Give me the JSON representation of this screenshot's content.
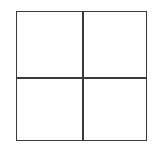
{
  "diagram": {
    "type": "grid",
    "rows": 2,
    "columns": 2,
    "line_color": "#3a3a3a",
    "background": "#ffffff",
    "cells": [
      {
        "row": 0,
        "col": 0,
        "label": ""
      },
      {
        "row": 0,
        "col": 1,
        "label": ""
      },
      {
        "row": 1,
        "col": 0,
        "label": ""
      },
      {
        "row": 1,
        "col": 1,
        "label": ""
      }
    ]
  }
}
